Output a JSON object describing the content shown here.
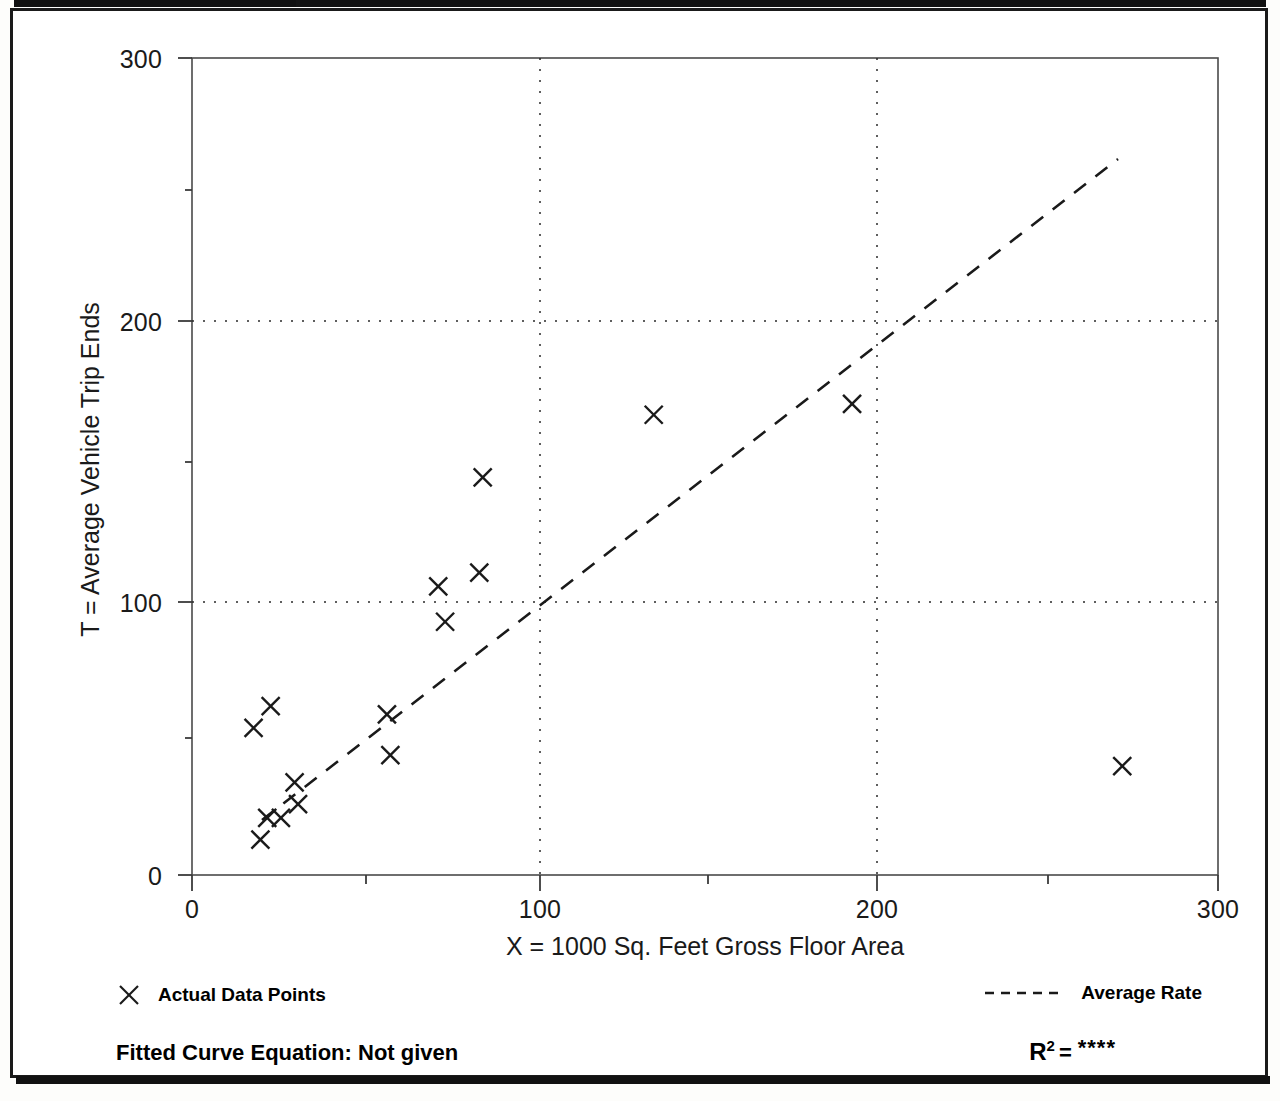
{
  "page": {
    "background_color": "#ffffff",
    "frame_color": "#1a1a1a"
  },
  "axes": {
    "y_title": "T = Average Vehicle Trip Ends",
    "x_title": "X = 1000 Sq. Feet Gross Floor Area",
    "y_ticks": [
      "0",
      "100",
      "200",
      "300"
    ],
    "x_ticks": [
      "0",
      "100",
      "200",
      "300"
    ]
  },
  "legend": {
    "data_points_label": "Actual Data Points",
    "data_points_marker": "x-marker-icon",
    "average_rate_label": "Average Rate",
    "average_rate_marker": "dashed-line-icon"
  },
  "footer": {
    "equation_label": "Fitted Curve Equation:",
    "equation_value": "Not given",
    "equation_full": "Fitted Curve Equation:  Not given",
    "r2_letter": "R",
    "r2_exponent": "2",
    "r2_equals": "=",
    "r2_value": "****"
  },
  "chart_data": {
    "type": "scatter",
    "title": "",
    "xlabel": "X = 1000 Sq. Feet Gross Floor Area",
    "ylabel": "T = Average Vehicle Trip Ends",
    "xlim": [
      0,
      300
    ],
    "ylim": [
      0,
      300
    ],
    "xticks": [
      0,
      100,
      200,
      300
    ],
    "yticks": [
      0,
      100,
      200,
      300
    ],
    "grid": true,
    "grid_style": "dotted",
    "legend_position": "below-plot",
    "series": [
      {
        "name": "Actual Data Points",
        "marker": "x",
        "color": "#1a1a1a",
        "points": [
          [
            20,
            13
          ],
          [
            18,
            54
          ],
          [
            23,
            62
          ],
          [
            22,
            21
          ],
          [
            26,
            21
          ],
          [
            30,
            34
          ],
          [
            31,
            26
          ],
          [
            57,
            59
          ],
          [
            58,
            44
          ],
          [
            72,
            106
          ],
          [
            74,
            93
          ],
          [
            84,
            111
          ],
          [
            85,
            146
          ],
          [
            135,
            169
          ],
          [
            193,
            173
          ],
          [
            272,
            40
          ]
        ]
      }
    ],
    "trend_line": {
      "name": "Average Rate",
      "style": "dashed",
      "color": "#1a1a1a",
      "start": [
        20,
        20
      ],
      "end": [
        266,
        263
      ]
    }
  }
}
